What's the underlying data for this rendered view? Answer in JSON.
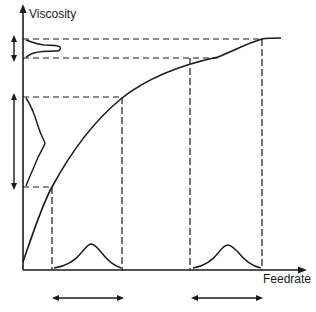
{
  "diagram": {
    "type": "viscosity-feedrate response diagram",
    "y_axis_label": "Viscosity",
    "x_axis_label": "Feedrate",
    "curve": "concave increasing (saturating) viscosity vs feedrate",
    "cases": [
      {
        "name": "low-feedrate",
        "feedrate_distribution": "wide bell curve",
        "viscosity_distribution": "wide spread, skewed"
      },
      {
        "name": "high-feedrate",
        "feedrate_distribution": "same-width bell curve",
        "viscosity_distribution": "narrow spread, peaked"
      }
    ],
    "colors": {
      "ink": "#1a1a1a",
      "background": "#ffffff"
    }
  }
}
